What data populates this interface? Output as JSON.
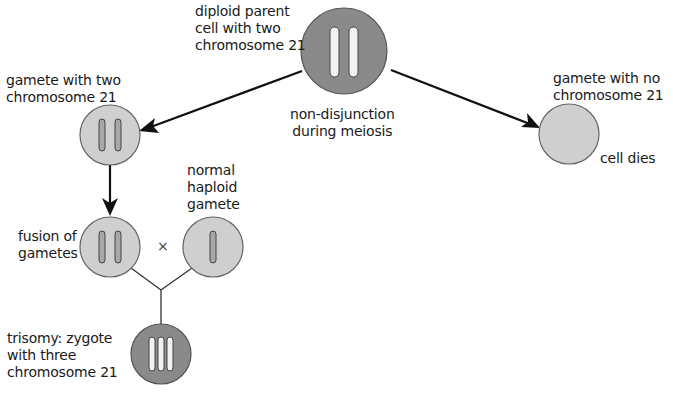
{
  "diagram": {
    "colors": {
      "dark_cell_fill": "#8a8a8a",
      "light_cell_fill": "#cfcfcf",
      "cell_stroke": "#555555",
      "chromosome_fill_light": "#f2f2f2",
      "chromosome_fill_dark": "#a8a8a8",
      "arrow": "#111111",
      "background": "#ffffff"
    },
    "nodes": [
      {
        "id": "parent",
        "label": "diploid parent\ncell with two\nchromosome 21",
        "chromosomes": 2,
        "shade": "dark"
      },
      {
        "id": "gamete-two",
        "label": "gamete with two\nchromosome 21",
        "chromosomes": 2,
        "shade": "light"
      },
      {
        "id": "gamete-none",
        "label": "gamete with no\nchromosome 21",
        "chromosomes": 0,
        "shade": "light",
        "note": "cell dies"
      },
      {
        "id": "fusion",
        "label": "fusion of\ngametes",
        "chromosomes": 2,
        "shade": "light"
      },
      {
        "id": "normal",
        "label": "normal\nhaploid\ngamete",
        "chromosomes": 1,
        "shade": "light"
      },
      {
        "id": "trisomy",
        "label": "trisomy: zygote\nwith three\nchromosome 21",
        "chromosomes": 3,
        "shade": "dark"
      }
    ],
    "process_label": "non-disjunction\nduring meiosis",
    "cross_symbol": "×",
    "edges": [
      {
        "from": "parent",
        "to": "gamete-two",
        "type": "arrow"
      },
      {
        "from": "parent",
        "to": "gamete-none",
        "type": "arrow"
      },
      {
        "from": "gamete-two",
        "to": "fusion",
        "type": "arrow"
      },
      {
        "from": "fusion",
        "to": "trisomy",
        "type": "line-join"
      },
      {
        "from": "normal",
        "to": "trisomy",
        "type": "line-join"
      }
    ]
  },
  "labels": {
    "parent": "diploid parent\ncell with two\nchromosome 21",
    "process": "non-disjunction\nduring meiosis",
    "gamete_two": "gamete with two\nchromosome 21",
    "gamete_none": "gamete with no\nchromosome 21",
    "cell_dies": "cell dies",
    "fusion": "fusion of\ngametes",
    "normal": "normal\nhaploid\ngamete",
    "cross": "×",
    "trisomy": "trisomy: zygote\nwith three\nchromosome 21"
  }
}
